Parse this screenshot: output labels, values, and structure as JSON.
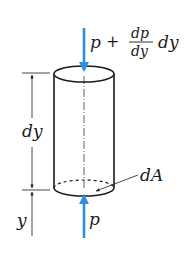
{
  "figure": {
    "colors": {
      "arrow": "#2e8ee0",
      "line": "#1a1a1a",
      "background": "#ffffff"
    },
    "labels": {
      "top_force_p": "p",
      "top_force_plus": "+",
      "top_force_frac_num": "dp",
      "top_force_frac_den": "dy",
      "top_force_suffix": "dy",
      "height_label": "dy",
      "area_label": "dA",
      "elevation_label": "y",
      "bottom_force": "p"
    }
  }
}
